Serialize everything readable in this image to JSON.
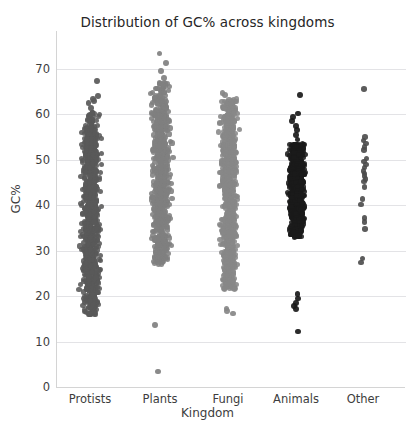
{
  "chart_data": {
    "type": "scatter",
    "title": "Distribution of GC% across kingdoms",
    "xlabel": "Kingdom",
    "ylabel": "GC%",
    "categories": [
      "Protists",
      "Plants",
      "Fungi",
      "Animals",
      "Other"
    ],
    "ytick_labels": [
      "0",
      "10",
      "20",
      "30",
      "40",
      "50",
      "60",
      "70"
    ],
    "yticks": [
      0,
      10,
      20,
      30,
      40,
      50,
      60,
      70
    ],
    "ylim": [
      0,
      75
    ],
    "grid": "horizontal",
    "legend": "none",
    "plot_style": "strip plot / jittered categorical scatter",
    "series": [
      {
        "name": "Protists",
        "color": "#595959",
        "x_center_px": 90,
        "jitter_half_width_px": 14,
        "approx_count": 900,
        "summary": {
          "min": 15.8,
          "q1": 29.5,
          "median": 39.0,
          "q3": 49.5,
          "max_main": 60.0,
          "outliers_high": [
            61.5,
            62.5,
            63.0,
            63.4,
            64.0,
            67.4
          ]
        },
        "distribution_bands": [
          {
            "low": 15.8,
            "high": 19.0,
            "density": 0.06
          },
          {
            "low": 19.0,
            "high": 24.0,
            "density": 0.13
          },
          {
            "low": 24.0,
            "high": 30.0,
            "density": 0.16
          },
          {
            "low": 30.0,
            "high": 38.0,
            "density": 0.2
          },
          {
            "low": 38.0,
            "high": 46.0,
            "density": 0.2
          },
          {
            "low": 46.0,
            "high": 54.0,
            "density": 0.16
          },
          {
            "low": 54.0,
            "high": 60.5,
            "density": 0.09
          }
        ]
      },
      {
        "name": "Plants",
        "color": "#808080",
        "x_center_px": 160,
        "jitter_half_width_px": 14,
        "approx_count": 850,
        "summary": {
          "min_main": 27.0,
          "q1": 35.5,
          "median": 42.0,
          "q3": 51.0,
          "max_main": 66.5,
          "outliers_high": [
            68.0,
            69.5,
            71.3,
            73.4
          ],
          "outliers_low": [
            13.6,
            3.4
          ]
        },
        "distribution_bands": [
          {
            "low": 27.0,
            "high": 31.0,
            "density": 0.07
          },
          {
            "low": 31.0,
            "high": 36.0,
            "density": 0.14
          },
          {
            "low": 36.0,
            "high": 42.0,
            "density": 0.2
          },
          {
            "low": 42.0,
            "high": 48.0,
            "density": 0.2
          },
          {
            "low": 48.0,
            "high": 55.0,
            "density": 0.17
          },
          {
            "low": 55.0,
            "high": 61.0,
            "density": 0.14
          },
          {
            "low": 61.0,
            "high": 67.0,
            "density": 0.08
          }
        ]
      },
      {
        "name": "Fungi",
        "color": "#878787",
        "x_center_px": 228,
        "jitter_half_width_px": 13,
        "approx_count": 800,
        "summary": {
          "min_main": 21.5,
          "q1": 34.0,
          "median": 43.0,
          "q3": 52.0,
          "max_main": 63.0,
          "outliers_high": [
            64.2,
            64.8
          ],
          "outliers_low": [
            16.2,
            16.8,
            17.3
          ]
        },
        "distribution_bands": [
          {
            "low": 21.5,
            "high": 26.0,
            "density": 0.1
          },
          {
            "low": 26.0,
            "high": 33.0,
            "density": 0.15
          },
          {
            "low": 33.0,
            "high": 40.0,
            "density": 0.17
          },
          {
            "low": 40.0,
            "high": 47.0,
            "density": 0.19
          },
          {
            "low": 47.0,
            "high": 54.0,
            "density": 0.19
          },
          {
            "low": 54.0,
            "high": 60.0,
            "density": 0.14
          },
          {
            "low": 60.0,
            "high": 63.5,
            "density": 0.06
          }
        ]
      },
      {
        "name": "Animals",
        "color": "#1a1a1a",
        "x_center_px": 296,
        "jitter_half_width_px": 12,
        "approx_count": 1000,
        "summary": {
          "min_main": 33.0,
          "q1": 39.5,
          "median": 44.0,
          "q3": 48.5,
          "max_main": 53.0,
          "outliers_high": [
            54.5,
            55.5,
            56.5,
            57.5,
            58.5,
            59.5,
            60.2,
            64.2
          ],
          "outliers_low": [
            20.5,
            19.5,
            18.5,
            17.8,
            17.2,
            12.2
          ]
        },
        "distribution_bands": [
          {
            "low": 33.0,
            "high": 37.0,
            "density": 0.12
          },
          {
            "low": 37.0,
            "high": 41.0,
            "density": 0.22
          },
          {
            "low": 41.0,
            "high": 45.0,
            "density": 0.24
          },
          {
            "low": 45.0,
            "high": 49.0,
            "density": 0.24
          },
          {
            "low": 49.0,
            "high": 53.5,
            "density": 0.18
          }
        ]
      },
      {
        "name": "Other",
        "color": "#4a4a4a",
        "x_center_px": 363,
        "jitter_half_width_px": 7,
        "approx_count": 24,
        "points": [
          65.6,
          55.0,
          54.3,
          53.6,
          52.8,
          52.2,
          50.3,
          49.6,
          49.0,
          48.3,
          47.6,
          47.0,
          46.4,
          45.8,
          45.2,
          44.0,
          41.4,
          40.2,
          37.2,
          36.3,
          34.8,
          28.3,
          27.4
        ]
      }
    ]
  }
}
